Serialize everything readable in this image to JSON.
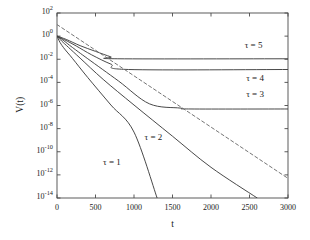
{
  "chart_data": {
    "type": "line",
    "title": "",
    "subtitle": "",
    "xlabel": "t",
    "ylabel": "V(t)",
    "xlim": [
      0,
      3000
    ],
    "ylim": [
      1e-14,
      100
    ],
    "yscale": "log",
    "xscale": "linear",
    "grid": false,
    "legend": "inline annotations",
    "xticks": [
      0,
      500,
      1000,
      1500,
      2000,
      2500,
      3000
    ],
    "xtick_labels": [
      "0",
      "500",
      "1000",
      "1500",
      "2000",
      "2500",
      "3000"
    ],
    "yticks": [
      100,
      1,
      0.01,
      0.0001,
      1e-06,
      1e-08,
      1e-10,
      1e-12,
      1e-14
    ],
    "ytick_mantissas": [
      "10",
      "10",
      "10",
      "10",
      "10",
      "10",
      "10",
      "10",
      "10"
    ],
    "ytick_exponents": [
      "2",
      "0",
      "-2",
      "-4",
      "-6",
      "-8",
      "-10",
      "-12",
      "-14"
    ],
    "series": [
      {
        "name": "tau = 1",
        "label": "τ = 1",
        "style": "solid",
        "color": "#3f3f3f",
        "label_x": 700,
        "label_y": 1e-11,
        "points": [
          {
            "t": 0,
            "v": 1
          },
          {
            "t": 40,
            "v": 0.28
          },
          {
            "t": 100,
            "v": 0.075
          },
          {
            "t": 200,
            "v": 0.012
          },
          {
            "t": 400,
            "v": 0.00026
          },
          {
            "t": 700,
            "v": 1.1e-06
          },
          {
            "t": 1000,
            "v": 5e-09
          },
          {
            "t": 1300,
            "v": 1e-14
          }
        ]
      },
      {
        "name": "tau = 2",
        "label": "τ = 2",
        "style": "solid",
        "color": "#3f3f3f",
        "label_x": 1240,
        "label_y": 1.6e-09,
        "points": [
          {
            "t": 0,
            "v": 1
          },
          {
            "t": 60,
            "v": 0.38
          },
          {
            "t": 150,
            "v": 0.105
          },
          {
            "t": 300,
            "v": 0.0125
          },
          {
            "t": 600,
            "v": 0.00018
          },
          {
            "t": 1000,
            "v": 1.1e-06
          },
          {
            "t": 1500,
            "v": 2.2e-09
          },
          {
            "t": 2000,
            "v": 4.5e-12
          },
          {
            "t": 2600,
            "v": 1e-14
          }
        ]
      },
      {
        "name": "tau = 3",
        "label": "τ = 3",
        "style": "solid",
        "color": "#3f3f3f",
        "plateau": 5e-07,
        "plateau_start": 1740,
        "label_x": 2560,
        "label_y": 8e-06,
        "points": [
          {
            "t": 0,
            "v": 1
          },
          {
            "t": 80,
            "v": 0.44
          },
          {
            "t": 200,
            "v": 0.105
          },
          {
            "t": 400,
            "v": 0.011
          },
          {
            "t": 800,
            "v": 0.00013
          },
          {
            "t": 1200,
            "v": 1.4e-06
          },
          {
            "t": 1600,
            "v": 6e-07
          },
          {
            "t": 1740,
            "v": 5e-07
          },
          {
            "t": 3000,
            "v": 5e-07
          }
        ]
      },
      {
        "name": "tau = 4",
        "label": "τ = 4",
        "style": "solid",
        "color": "#3f3f3f",
        "plateau": 0.0013,
        "plateau_start": 930,
        "label_x": 2560,
        "label_y": 0.0002,
        "points": [
          {
            "t": 0,
            "v": 1
          },
          {
            "t": 100,
            "v": 0.48
          },
          {
            "t": 250,
            "v": 0.14
          },
          {
            "t": 450,
            "v": 0.024
          },
          {
            "t": 700,
            "v": 0.0038
          },
          {
            "t": 930,
            "v": 0.0013
          },
          {
            "t": 3000,
            "v": 0.0013
          }
        ]
      },
      {
        "name": "tau = 5",
        "label": "τ = 5",
        "style": "solid",
        "color": "#3f3f3f",
        "plateau": 0.011,
        "plateau_start": 790,
        "label_x": 2540,
        "label_y": 0.13,
        "points": [
          {
            "t": 0,
            "v": 1
          },
          {
            "t": 120,
            "v": 0.52
          },
          {
            "t": 300,
            "v": 0.15
          },
          {
            "t": 500,
            "v": 0.048
          },
          {
            "t": 700,
            "v": 0.016
          },
          {
            "t": 790,
            "v": 0.011
          },
          {
            "t": 3000,
            "v": 0.011
          }
        ]
      },
      {
        "name": "reference asymptote",
        "label": "",
        "style": "dashed",
        "color": "#6e6e6e",
        "points": [
          {
            "t": 0,
            "v": 10
          },
          {
            "t": 3000,
            "v": 5e-13
          }
        ]
      }
    ]
  },
  "figure": {
    "background": "#ffffff",
    "axis_color": "#4a4a4a",
    "text_color": "#1a1a1a"
  }
}
